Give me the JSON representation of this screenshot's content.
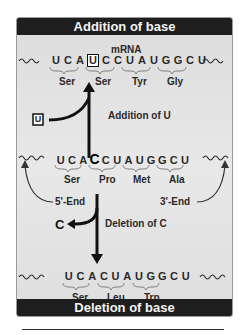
{
  "header": {
    "title": "Addition of base"
  },
  "footer": {
    "title": "Deletion of base"
  },
  "mrna_label": "mRNA",
  "rows": {
    "addition": {
      "bases": [
        "U",
        "C",
        "A",
        "U",
        "C",
        "C",
        "U",
        "A",
        "U",
        "G",
        "G",
        "C",
        "U"
      ],
      "inserted_index": 3,
      "codons": [
        "Ser",
        "Ser",
        "Tyr",
        "Gly"
      ]
    },
    "original": {
      "bases": [
        "U",
        "C",
        "A",
        "C",
        "C",
        "U",
        "A",
        "U",
        "G",
        "G",
        "C",
        "U"
      ],
      "highlight_index": 3,
      "codons": [
        "Ser",
        "Pro",
        "Met",
        "Ala"
      ]
    },
    "deletion": {
      "bases": [
        "U",
        "C",
        "A",
        "C",
        "U",
        "A",
        "U",
        "G",
        "G",
        "C",
        "U"
      ],
      "codons": [
        "Ser",
        "Leu",
        "Trp"
      ]
    }
  },
  "annotations": {
    "addition_label": "Addition of U",
    "added_base": "U",
    "deletion_label": "Deletion of C",
    "deleted_base": "C",
    "five_prime": "5'-End",
    "three_prime": "3'-End"
  },
  "colors": {
    "bar": "#1e1e1e",
    "panel": "#e2e2e2",
    "text": "#2a2a2a"
  }
}
